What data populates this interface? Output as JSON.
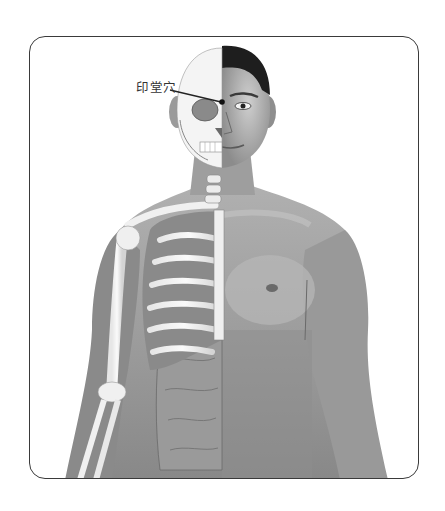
{
  "diagram": {
    "acupoint": {
      "label": "印堂穴",
      "marker": "dot between eyebrows",
      "label_color": "#333333"
    },
    "colors": {
      "frame_border": "#3a3a3a",
      "skin_light": "#bdbdbd",
      "skin_mid": "#9a9a9a",
      "skin_dark": "#6e6e6e",
      "bone": "#f2f2f2",
      "hair": "#1e1e1e"
    }
  }
}
